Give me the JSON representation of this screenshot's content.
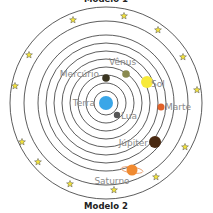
{
  "diagram": {
    "top_title": "Modelo 1",
    "bottom_title": "Modelo 2",
    "center": [
      106,
      103
    ],
    "orbit_radii": [
      12,
      20,
      28,
      36,
      44,
      52,
      60,
      68,
      82,
      96
    ],
    "orbit_color": "#333333",
    "star_color": "#f2e23a",
    "bodies": [
      {
        "name": "Terra",
        "label": "Terra",
        "x": 106,
        "y": 103,
        "r": 7,
        "color": "#3aa6e8",
        "lx": 95,
        "ly": 106,
        "anchor": "end"
      },
      {
        "name": "Lua",
        "label": "Lua",
        "x": 117,
        "y": 115,
        "r": 3.2,
        "color": "#555555",
        "lx": 121,
        "ly": 119,
        "anchor": "start"
      },
      {
        "name": "Mercúrio",
        "label": "Mercúrio",
        "x": 106,
        "y": 78,
        "r": 3.8,
        "color": "#3a3520",
        "lx": 99,
        "ly": 77,
        "anchor": "end"
      },
      {
        "name": "Vênus",
        "label": "Vênus",
        "x": 126,
        "y": 74,
        "r": 3.8,
        "color": "#8a8a50",
        "lx": 109,
        "ly": 65,
        "anchor": "start"
      },
      {
        "name": "Sol",
        "label": "Sol",
        "x": 147,
        "y": 82,
        "r": 6,
        "color": "#f7ea3a",
        "lx": 151,
        "ly": 87,
        "anchor": "start"
      },
      {
        "name": "Marte",
        "label": "Marte",
        "x": 161,
        "y": 107,
        "r": 3.5,
        "color": "#e0622a",
        "lx": 165,
        "ly": 110,
        "anchor": "start"
      },
      {
        "name": "Júpiter",
        "label": "Júpiter",
        "x": 155,
        "y": 142,
        "r": 6,
        "color": "#4a2a12",
        "lx": 148,
        "ly": 146,
        "anchor": "end"
      },
      {
        "name": "Saturno",
        "label": "Saturno",
        "x": 132,
        "y": 170,
        "r": 5.5,
        "color": "#f08a30",
        "lx": 112,
        "ly": 184,
        "anchor": "middle"
      }
    ],
    "stars": [
      [
        73,
        20
      ],
      [
        124,
        16
      ],
      [
        158,
        30
      ],
      [
        183,
        57
      ],
      [
        197,
        90
      ],
      [
        29,
        55
      ],
      [
        15,
        86
      ],
      [
        22,
        142
      ],
      [
        38,
        162
      ],
      [
        70,
        184
      ],
      [
        114,
        190
      ],
      [
        156,
        177
      ],
      [
        185,
        147
      ]
    ]
  }
}
